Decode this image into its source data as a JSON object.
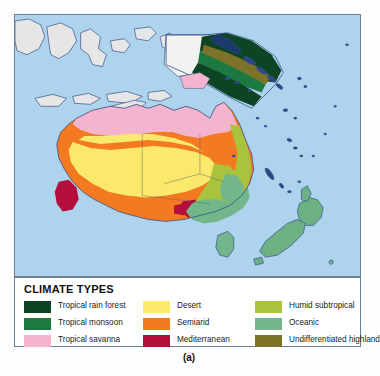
{
  "figure": {
    "caption": "(a)",
    "map_alt_name": "australia-oceania-climate-map"
  },
  "colors": {
    "ocean": "#aed3ec",
    "frame_border": "#6d7f93",
    "coastline": "#36518c",
    "country_border": "#4a5d7e",
    "unclassified_land": "#e4e4e4",
    "page_background": "#fdfdfd",
    "legend_background": "#ffffff"
  },
  "legend": {
    "title": "CLIMATE TYPES",
    "columns": [
      {
        "name": "column-1",
        "items": [
          {
            "label": "Tropical rain forest",
            "color": "#0d4423"
          },
          {
            "label": "Tropical monsoon",
            "color": "#1c7a41"
          },
          {
            "label": "Tropical savanna",
            "color": "#f4b4cd"
          }
        ]
      },
      {
        "name": "column-2",
        "items": [
          {
            "label": "Desert",
            "color": "#fbe96b"
          },
          {
            "label": "Semiarid",
            "color": "#f47a21"
          },
          {
            "label": "Mediterranean",
            "color": "#b40f3c"
          }
        ]
      },
      {
        "name": "column-3",
        "items": [
          {
            "label": "Humid subtropical",
            "color": "#a9c43c"
          },
          {
            "label": "Oceanic",
            "color": "#72b68a"
          },
          {
            "label": "Undifferentiated highland",
            "color": "#7d7328"
          }
        ]
      }
    ]
  },
  "map": {
    "regions": [
      {
        "name": "indonesia-islands",
        "climate": "unclassified"
      },
      {
        "name": "new-guinea-rainforest",
        "climate": "Tropical rain forest"
      },
      {
        "name": "new-guinea-highland",
        "climate": "Undifferentiated highland"
      },
      {
        "name": "new-guinea-monsoon",
        "climate": "Tropical monsoon"
      },
      {
        "name": "northern-australia-savanna",
        "climate": "Tropical savanna"
      },
      {
        "name": "interior-australia-desert",
        "climate": "Desert"
      },
      {
        "name": "australia-semiarid-ring",
        "climate": "Semiarid"
      },
      {
        "name": "southwest-australia-mediterranean",
        "climate": "Mediterranean"
      },
      {
        "name": "south-australia-mediterranean",
        "climate": "Mediterranean"
      },
      {
        "name": "east-australia-humid-subtropical",
        "climate": "Humid subtropical"
      },
      {
        "name": "southeast-australia-oceanic",
        "climate": "Oceanic"
      },
      {
        "name": "tasmania-oceanic",
        "climate": "Oceanic"
      },
      {
        "name": "new-zealand-oceanic",
        "climate": "Oceanic"
      },
      {
        "name": "pacific-islands",
        "climate": "unclassified"
      }
    ]
  }
}
